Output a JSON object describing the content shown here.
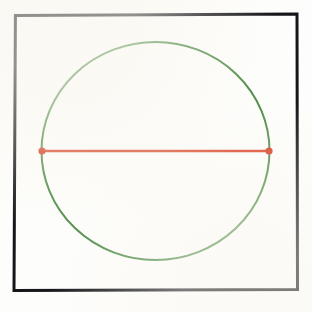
{
  "figure": {
    "canvas": {
      "width": 312,
      "height": 312,
      "background_color": "#fdfdfb",
      "interior_color": "#fefefd"
    },
    "frame": {
      "label": "Square border frame",
      "color": "#15161a",
      "stroke_width": 3,
      "left": 14.5,
      "top": 14.5,
      "right": 297,
      "bottom": 290
    },
    "circle": {
      "label": "Green circle outline",
      "color": "#4d8c46",
      "stroke_width": 2,
      "center_x": 155.5,
      "center_y": 151,
      "radius_x": 114,
      "radius_y": 109
    },
    "chord": {
      "label": "Red horizontal diameter",
      "color": "#d9482a",
      "stroke_width": 2.6,
      "x1": 42,
      "y1": 151,
      "x2": 269,
      "y2": 151,
      "length": 227
    },
    "endpoints": [
      {
        "label": "Left endpoint marker",
        "cx": 42,
        "cy": 151,
        "radius": 3.6,
        "color": "#d53f22"
      },
      {
        "label": "Right endpoint marker",
        "cx": 269,
        "cy": 151,
        "radius": 3.6,
        "color": "#d53f22"
      }
    ]
  },
  "chart_data": {
    "type": "scatter",
    "xlabel": "",
    "ylabel": "",
    "xlim": [
      0,
      312
    ],
    "ylim": [
      312,
      0
    ],
    "grid": false,
    "legend": "none",
    "annotations": [
      "Black square frame encloses the figure",
      "Green circle inscribed within the frame",
      "Red line segment spans the circle horizontally through its center",
      "Red dots mark where the segment meets the circle"
    ],
    "shapes": [
      {
        "kind": "rectangle",
        "name": "frame",
        "x": 14.5,
        "y": 14.5,
        "width": 282.5,
        "height": 275.5,
        "edgecolor": "#15161a",
        "facecolor": "none",
        "linewidth": 3
      },
      {
        "kind": "ellipse",
        "name": "circle",
        "cx": 155.5,
        "cy": 151,
        "rx": 114,
        "ry": 109,
        "edgecolor": "#4d8c46",
        "facecolor": "none",
        "linewidth": 2
      },
      {
        "kind": "line",
        "name": "chord",
        "x": [
          42,
          269
        ],
        "y": [
          151,
          151
        ],
        "color": "#d9482a",
        "linewidth": 2.6
      }
    ],
    "points": [
      {
        "x": 42,
        "y": 151,
        "color": "#d53f22",
        "size": 7
      },
      {
        "x": 269,
        "y": 151,
        "color": "#d53f22",
        "size": 7
      }
    ]
  }
}
